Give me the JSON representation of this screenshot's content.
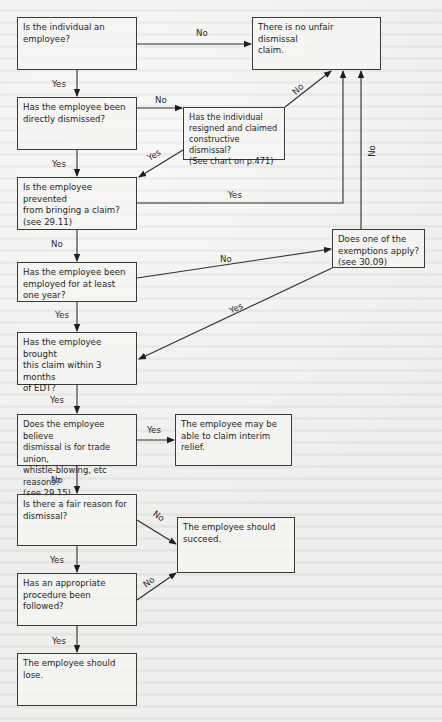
{
  "flowchart": {
    "nodes": {
      "is_employee": "Is the individual an\nemployee?",
      "no_claim": "There is no unfair dismissal\nclaim.",
      "directly_dismissed": "Has the employee been\ndirectly dismissed?",
      "constructive": "Has the individual\nresigned and claimed\nconstructive dismissal?\n(See chart on p.471)",
      "prevented": "Is the employee prevented\nfrom bringing a claim?\n(see 29.11)",
      "exemptions": "Does one of the\nexemptions apply?\n(see 30.09)",
      "one_year": "Has the employee been\nemployed for at least\none year?",
      "three_months": "Has the employee brought\nthis claim within 3 months\nof EDT?",
      "trade_union": "Does the employee believe\ndismissal is for trade union,\nwhistle-blowing, etc reasons?\n(see 29.15)",
      "interim_relief": "The employee may be\nable to claim interim\nrelief.",
      "fair_reason": "Is there a fair reason for\ndismissal?",
      "should_succeed": "The employee should\nsucceed.",
      "procedure": "Has an appropriate\nprocedure been followed?",
      "should_lose": "The employee should lose."
    },
    "edges": {
      "is_employee_no": "No",
      "is_employee_yes": "Yes",
      "directly_no": "No",
      "directly_yes": "Yes",
      "constructive_no": "No",
      "constructive_yes": "Yes",
      "prevented_yes": "Yes",
      "prevented_no": "No",
      "exemptions_no": "No",
      "exemptions_yes": "Yes",
      "one_year_no": "No",
      "one_year_yes": "Yes",
      "three_months_yes": "Yes",
      "trade_union_yes": "Yes",
      "trade_union_no": "No",
      "fair_reason_no": "No",
      "fair_reason_yes": "Yes",
      "procedure_no": "No",
      "procedure_yes": "Yes"
    }
  }
}
